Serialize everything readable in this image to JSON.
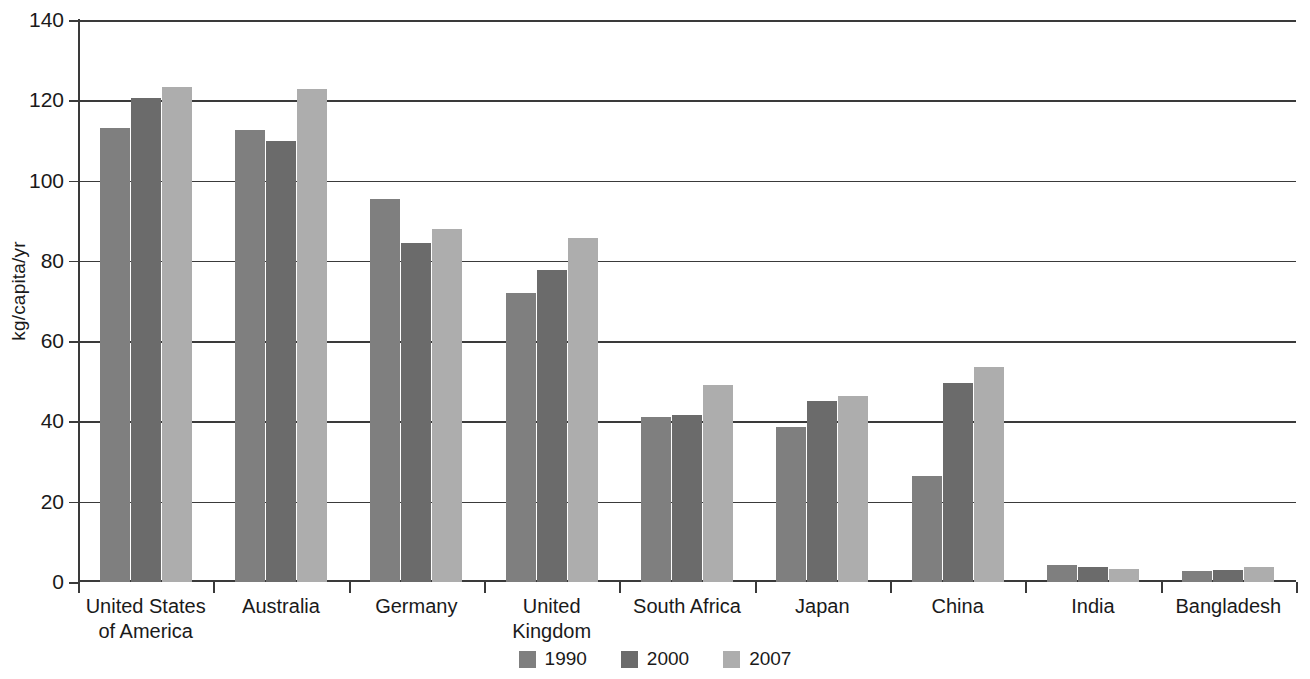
{
  "chart_data": {
    "type": "bar",
    "title": "",
    "xlabel": "",
    "ylabel": "kg/capita/yr",
    "ylim": [
      0,
      140
    ],
    "ytick_step": 20,
    "yticks": [
      "0",
      "20",
      "40",
      "60",
      "80",
      "100",
      "120",
      "140"
    ],
    "grid": true,
    "legend_position": "bottom",
    "categories": [
      "United States\nof America",
      "Australia",
      "Germany",
      "United\nKingdom",
      "South Africa",
      "Japan",
      "China",
      "India",
      "Bangladesh"
    ],
    "series": [
      {
        "name": "1990",
        "color": "#7f7f7f",
        "values": [
          113.0,
          112.5,
          95.5,
          72.0,
          41.0,
          38.5,
          26.5,
          4.3,
          2.7
        ]
      },
      {
        "name": "2000",
        "color": "#6b6b6b",
        "values": [
          120.5,
          109.8,
          84.5,
          77.8,
          41.7,
          45.2,
          49.5,
          3.7,
          3.1
        ]
      },
      {
        "name": "2007",
        "color": "#adadad",
        "values": [
          123.3,
          122.8,
          88.0,
          85.6,
          49.2,
          46.4,
          53.5,
          3.2,
          3.7
        ]
      }
    ]
  },
  "legend": {
    "items": [
      {
        "label": "1990",
        "color": "#7f7f7f"
      },
      {
        "label": "2000",
        "color": "#6b6b6b"
      },
      {
        "label": "2007",
        "color": "#adadad"
      }
    ]
  },
  "axis": {
    "y_title": "kg/capita/yr"
  }
}
